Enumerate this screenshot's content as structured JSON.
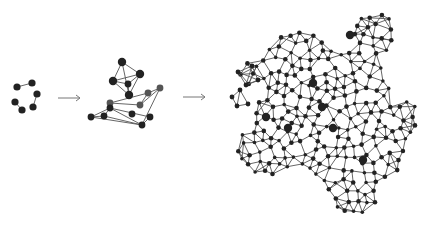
{
  "diagram": {
    "title": "",
    "colors": {
      "node": "#222222",
      "node_grey": "#555555",
      "edge": "#555555",
      "arrow": "#777777",
      "background": "#ffffff"
    },
    "stages": [
      {
        "name": "stage-1-small-components",
        "nodes": [
          [
            17,
            87
          ],
          [
            32,
            83
          ],
          [
            37,
            94
          ],
          [
            15,
            102
          ],
          [
            22,
            110
          ],
          [
            33,
            107
          ]
        ],
        "edges": [
          [
            0,
            1
          ],
          [
            2,
            5
          ],
          [
            3,
            4
          ]
        ],
        "big": [],
        "grey": []
      },
      {
        "name": "stage-2-merged-clusters",
        "nodes": [
          [
            122,
            62
          ],
          [
            140,
            74
          ],
          [
            113,
            81
          ],
          [
            128,
            84
          ],
          [
            129,
            95
          ],
          [
            110,
            103
          ],
          [
            148,
            93
          ],
          [
            160,
            88
          ],
          [
            140,
            105
          ],
          [
            132,
            114
          ],
          [
            142,
            125
          ],
          [
            91,
            117
          ],
          [
            104,
            116
          ],
          [
            110,
            108
          ],
          [
            150,
            117
          ]
        ],
        "edges": [
          [
            0,
            1
          ],
          [
            0,
            2
          ],
          [
            0,
            4
          ],
          [
            1,
            2
          ],
          [
            1,
            4
          ],
          [
            1,
            3
          ],
          [
            2,
            3
          ],
          [
            3,
            4
          ],
          [
            2,
            4
          ],
          [
            6,
            7
          ],
          [
            7,
            10
          ],
          [
            6,
            5
          ],
          [
            5,
            8
          ],
          [
            8,
            6
          ],
          [
            8,
            7
          ],
          [
            13,
            11
          ],
          [
            13,
            14
          ],
          [
            13,
            12
          ],
          [
            11,
            12
          ],
          [
            12,
            10
          ],
          [
            11,
            10
          ],
          [
            14,
            10
          ],
          [
            13,
            10
          ]
        ],
        "big": [
          0,
          1,
          2,
          4
        ],
        "grey": [
          5,
          6,
          7,
          8
        ]
      },
      {
        "name": "stage-3-large-network",
        "cluster_bounds": {
          "x": [
            237,
            420
          ],
          "y": [
            10,
            218
          ]
        }
      }
    ],
    "arrows": [
      {
        "from": [
          58,
          98
        ],
        "to": [
          80,
          98
        ]
      },
      {
        "from": [
          183,
          97
        ],
        "to": [
          205,
          97
        ]
      }
    ]
  }
}
